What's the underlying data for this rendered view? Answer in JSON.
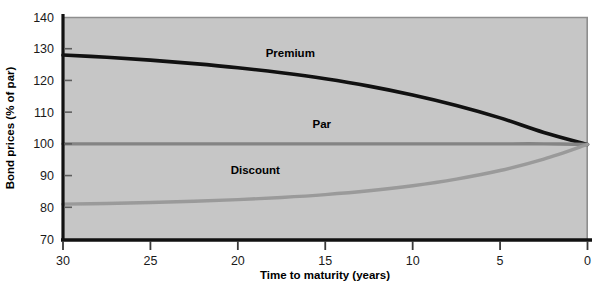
{
  "chart_data": {
    "type": "line",
    "title": "",
    "xlabel": "Time to maturity (years)",
    "ylabel": "Bond prices (% of par)",
    "xlim": [
      30,
      0
    ],
    "ylim": [
      70,
      140
    ],
    "x_ticks": [
      "30",
      "25",
      "20",
      "15",
      "10",
      "5",
      "0"
    ],
    "x_tick_values": [
      30,
      25,
      20,
      15,
      10,
      5,
      0
    ],
    "y_ticks": [
      "140",
      "130",
      "120",
      "110",
      "100",
      "90",
      "80",
      "70"
    ],
    "y_tick_values": [
      140,
      130,
      120,
      110,
      100,
      90,
      80,
      70
    ],
    "grid": false,
    "legend": "inline-annotations",
    "x": [
      30,
      27.5,
      25,
      22.5,
      20,
      17.5,
      15,
      12.5,
      10,
      7.5,
      5,
      2.5,
      0
    ],
    "series": [
      {
        "name": "Premium",
        "color": "#111111",
        "width": 3.6,
        "values": [
          128.0,
          127.3,
          126.4,
          125.3,
          124.0,
          122.4,
          120.5,
          118.2,
          115.4,
          112.1,
          108.2,
          103.6,
          99.8
        ]
      },
      {
        "name": "Par",
        "color": "#848484",
        "width": 3.4,
        "values": [
          100.0,
          100.0,
          100.0,
          100.0,
          100.0,
          100.0,
          100.0,
          100.0,
          100.0,
          100.0,
          100.0,
          100.0,
          99.8
        ]
      },
      {
        "name": "Discount",
        "color": "#9a9a9a",
        "width": 3.4,
        "values": [
          81.0,
          81.2,
          81.5,
          81.9,
          82.4,
          83.1,
          84.0,
          85.2,
          86.8,
          88.9,
          91.6,
          95.2,
          99.8
        ]
      }
    ],
    "annotations": [
      {
        "text": "Premium",
        "x": 17.0,
        "y": 127.5
      },
      {
        "text": "Par",
        "x": 15.2,
        "y": 105.0
      },
      {
        "text": "Discount",
        "x": 19.0,
        "y": 90.5
      }
    ],
    "colors": {
      "plot_background": "#c6c6c6",
      "page_background": "#ffffff",
      "axis": "#111111",
      "plot_border": "#8e8e8e",
      "text": "#1a1a1a"
    }
  }
}
